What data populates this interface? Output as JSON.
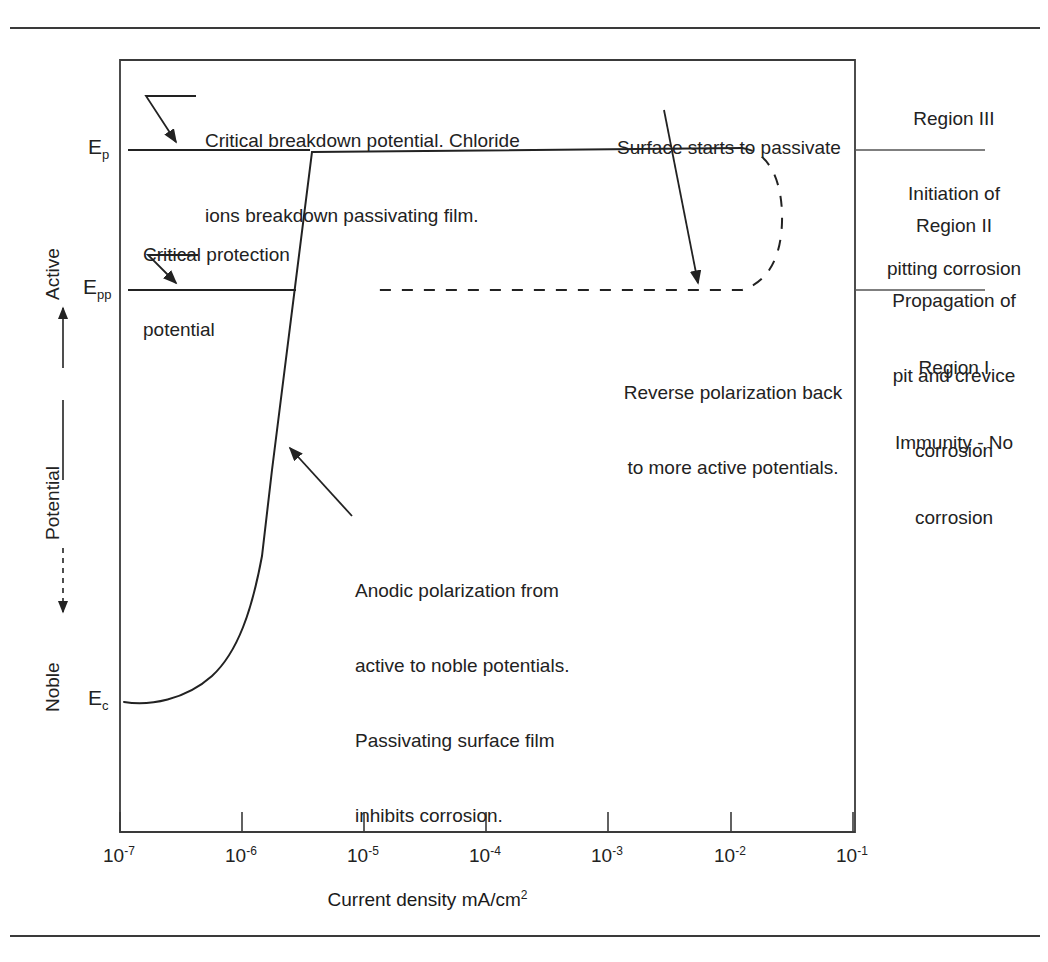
{
  "figure": {
    "type": "cyclic-potentiodynamic-polarization-diagram",
    "plot_frame": {
      "left": 120,
      "top": 60,
      "right": 855,
      "bottom": 832
    }
  },
  "axes": {
    "x": {
      "title_prefix": "Current density mA/cm",
      "title_sup": "2",
      "title_full": "Current density mA/cm2",
      "tick_base": "10",
      "ticks": [
        "-7",
        "-6",
        "-5",
        "-4",
        "-3",
        "-2",
        "-1"
      ],
      "tick_labels": [
        "10-7",
        "10-6",
        "10-5",
        "10-4",
        "10-3",
        "10-2",
        "10-1"
      ],
      "scale": "log"
    },
    "y": {
      "title": "Potential",
      "top_label": "Active",
      "bottom_label": "Noble",
      "direction_note": "Active at top, Noble at bottom"
    }
  },
  "potential_markers": [
    {
      "id": "Ep",
      "symbol": "E",
      "subscript": "p",
      "label": "Ep",
      "y": 150,
      "meaning": "Critical breakdown potential"
    },
    {
      "id": "Epp",
      "symbol": "E",
      "subscript": "pp",
      "label": "Epp",
      "y": 290,
      "meaning": "Critical protection potential"
    },
    {
      "id": "Ec",
      "symbol": "E",
      "subscript": "c",
      "label": "Ec",
      "y": 700,
      "meaning": "Corrosion potential"
    }
  ],
  "annotations": {
    "breakdown": {
      "line1": "Critical breakdown potential. Chloride",
      "line2": "ions breakdown passivating film."
    },
    "protection": {
      "line1": "Critical protection",
      "line2": "potential"
    },
    "passivate": {
      "line1": "Surface starts to passivate"
    },
    "reverse": {
      "line1": "Reverse polarization back",
      "line2": "to more active potentials."
    },
    "anodic": {
      "line1": "Anodic polarization from",
      "line2": "active to noble potentials.",
      "line3": "Passivating surface film",
      "line4": "inhibits corrosion."
    }
  },
  "regions": [
    {
      "id": "region-3",
      "title": "Region III",
      "line2": "Initiation of",
      "line3": "pitting corrosion"
    },
    {
      "id": "region-2",
      "title": "Region II",
      "line2": "Propagation of",
      "line3": "pit and crevice",
      "line4": "corrosion"
    },
    {
      "id": "region-1",
      "title": "Region I",
      "line2": "Immunity - No",
      "line3": "corrosion"
    }
  ],
  "curve": {
    "forward_style": "solid",
    "reverse_style": "dashed",
    "description": "Anodic scan rises from Ec, steep active-to-passive transition, plateau at Ep, reverse dashed loop returns at Epp"
  },
  "colors": {
    "ink": "#222222",
    "rule": "#3a3a3a",
    "background": "#ffffff"
  }
}
